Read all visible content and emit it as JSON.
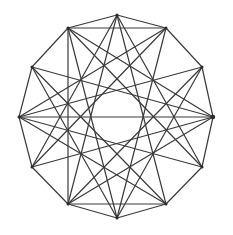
{
  "diagram": {
    "type": "graph",
    "width": 233,
    "height": 235,
    "colors": {
      "background": "#ffffff",
      "edge": "#3a3a3a",
      "vertex": "#2a2a2a"
    },
    "vertices": [
      {
        "id": 0,
        "x": 117,
        "y": 15
      },
      {
        "id": 1,
        "x": 166,
        "y": 28
      },
      {
        "id": 2,
        "x": 202,
        "y": 67
      },
      {
        "id": 3,
        "x": 213,
        "y": 117
      },
      {
        "id": 4,
        "x": 202,
        "y": 167
      },
      {
        "id": 5,
        "x": 166,
        "y": 204
      },
      {
        "id": 6,
        "x": 117,
        "y": 218
      },
      {
        "id": 7,
        "x": 68,
        "y": 204
      },
      {
        "id": 8,
        "x": 32,
        "y": 167
      },
      {
        "id": 9,
        "x": 19,
        "y": 117
      },
      {
        "id": 10,
        "x": 32,
        "y": 67
      },
      {
        "id": 11,
        "x": 68,
        "y": 28
      }
    ],
    "edges": [
      [
        0,
        1
      ],
      [
        1,
        2
      ],
      [
        2,
        3
      ],
      [
        3,
        4
      ],
      [
        4,
        5
      ],
      [
        5,
        6
      ],
      [
        6,
        7
      ],
      [
        7,
        8
      ],
      [
        8,
        9
      ],
      [
        9,
        10
      ],
      [
        10,
        11
      ],
      [
        11,
        0
      ],
      [
        0,
        5
      ],
      [
        1,
        6
      ],
      [
        2,
        7
      ],
      [
        3,
        8
      ],
      [
        4,
        9
      ],
      [
        5,
        10
      ],
      [
        6,
        11
      ],
      [
        7,
        0
      ],
      [
        8,
        1
      ],
      [
        9,
        2
      ],
      [
        10,
        3
      ],
      [
        11,
        4
      ],
      [
        0,
        4
      ],
      [
        0,
        8
      ],
      [
        9,
        1
      ],
      [
        9,
        5
      ],
      [
        11,
        7
      ],
      [
        11,
        3
      ],
      [
        7,
        3
      ],
      [
        6,
        10
      ],
      [
        6,
        2
      ],
      [
        11,
        1
      ],
      [
        7,
        5
      ],
      [
        9,
        3
      ]
    ]
  }
}
